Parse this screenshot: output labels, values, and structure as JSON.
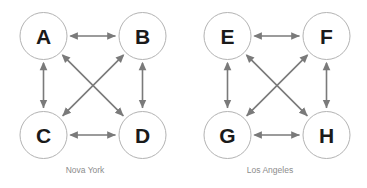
{
  "figure": {
    "background_color": "#ffffff",
    "width": 367,
    "height": 188
  },
  "style": {
    "node_fill": "#ffffff",
    "node_stroke": "#b3b3b3",
    "node_radius": 23.5,
    "edge_color": "#7a7a7a",
    "label_color": "#1a1a1a",
    "caption_color": "#8c8c8c"
  },
  "graphs": [
    {
      "id": "graph-nova-york",
      "caption": "Nova York",
      "caption_x": 85,
      "caption_y": 173,
      "nodes": [
        {
          "id": "A",
          "label": "A",
          "cx": 43.5,
          "cy": 36
        },
        {
          "id": "B",
          "label": "B",
          "cx": 142.5,
          "cy": 36
        },
        {
          "id": "C",
          "label": "C",
          "cx": 43.5,
          "cy": 135
        },
        {
          "id": "D",
          "label": "D",
          "cx": 142.5,
          "cy": 135
        }
      ],
      "edges": [
        {
          "id": "A-B",
          "from": "A",
          "to": "B",
          "type": "bidirectional",
          "orientation": "horizontal-top"
        },
        {
          "id": "C-D",
          "from": "C",
          "to": "D",
          "type": "bidirectional",
          "orientation": "horizontal-bottom"
        },
        {
          "id": "A-C",
          "from": "A",
          "to": "C",
          "type": "bidirectional",
          "orientation": "vertical-left"
        },
        {
          "id": "B-D",
          "from": "B",
          "to": "D",
          "type": "bidirectional",
          "orientation": "vertical-right"
        },
        {
          "id": "A-D",
          "from": "A",
          "to": "D",
          "type": "bidirectional",
          "orientation": "diagonal-down-right"
        },
        {
          "id": "B-C",
          "from": "B",
          "to": "C",
          "type": "bidirectional",
          "orientation": "diagonal-down-left"
        }
      ]
    },
    {
      "id": "graph-los-angeles",
      "caption": "Los Angeles",
      "caption_x": 270,
      "caption_y": 173,
      "nodes": [
        {
          "id": "E",
          "label": "E",
          "cx": 227.5,
          "cy": 36
        },
        {
          "id": "F",
          "label": "F",
          "cx": 326.5,
          "cy": 36
        },
        {
          "id": "G",
          "label": "G",
          "cx": 227.5,
          "cy": 135
        },
        {
          "id": "H",
          "label": "H",
          "cx": 326.5,
          "cy": 135
        }
      ],
      "edges": [
        {
          "id": "E-F",
          "from": "E",
          "to": "F",
          "type": "bidirectional",
          "orientation": "horizontal-top"
        },
        {
          "id": "G-H",
          "from": "G",
          "to": "H",
          "type": "bidirectional",
          "orientation": "horizontal-bottom"
        },
        {
          "id": "E-G",
          "from": "E",
          "to": "G",
          "type": "bidirectional",
          "orientation": "vertical-left"
        },
        {
          "id": "F-H",
          "from": "F",
          "to": "H",
          "type": "bidirectional",
          "orientation": "vertical-right"
        },
        {
          "id": "E-H",
          "from": "E",
          "to": "H",
          "type": "bidirectional",
          "orientation": "diagonal-down-right"
        },
        {
          "id": "F-G",
          "from": "F",
          "to": "G",
          "type": "bidirectional",
          "orientation": "diagonal-down-left"
        }
      ]
    }
  ]
}
